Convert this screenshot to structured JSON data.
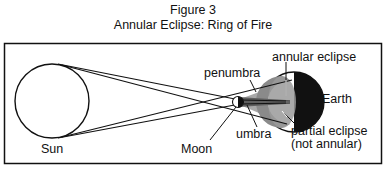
{
  "figure": {
    "number": "Figure 3",
    "title": "Annular Eclipse: Ring of Fire"
  },
  "labels": {
    "sun": "Sun",
    "moon": "Moon",
    "earth": "Earth",
    "penumbra": "penumbra",
    "umbra": "umbra",
    "annular_eclipse": "annular eclipse",
    "partial_eclipse": "partial eclipse",
    "not_annular": "(not annular)"
  },
  "colors": {
    "line": "#111111",
    "penumbra_fill": "#a8a8a8",
    "umbra_fill": "#6e6e6e",
    "earth_night": "#111111",
    "background": "#ffffff"
  }
}
